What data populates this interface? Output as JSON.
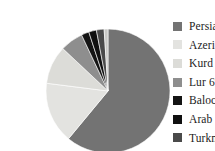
{
  "chart_data": {
    "type": "pie",
    "title": "",
    "subtitle": "",
    "xlabel": "",
    "ylabel": "",
    "grid": false,
    "legend_position": "right",
    "start_angle_deg": -90,
    "direction": "clockwise",
    "categories": [
      "Persian",
      "Azeri",
      "Kurd",
      "Lur",
      "Baloch",
      "Arab",
      "Turkmen",
      "Other"
    ],
    "values": [
      61,
      16,
      10,
      6,
      2,
      2,
      2,
      1
    ],
    "labels": [
      "Persian 6%",
      "Azeri 16%",
      "Kurd 10%",
      "Lur 6%",
      "Baloch 2%",
      "Arab 2%",
      "Turkmen 2%",
      "Other 1%"
    ],
    "colors": [
      "#737373",
      "#e3e3e0",
      "#dcdcd8",
      "#8e8e8e",
      "#141414",
      "#101010",
      "#4a4a4a",
      "#c9c9c6"
    ],
    "slices": [
      {
        "name": "Persian",
        "label": "Persian 6%",
        "value": 61,
        "percent": 61,
        "color": "#737373"
      },
      {
        "name": "Azeri",
        "label": "Azeri 16%",
        "value": 16,
        "percent": 16,
        "color": "#e3e3e0"
      },
      {
        "name": "Kurd",
        "label": "Kurd 10%",
        "value": 10,
        "percent": 10,
        "color": "#dcdcd8"
      },
      {
        "name": "Lur",
        "label": "Lur 6%",
        "value": 6,
        "percent": 6,
        "color": "#8e8e8e"
      },
      {
        "name": "Baloch",
        "label": "Baloch 2%",
        "value": 2,
        "percent": 2,
        "color": "#141414"
      },
      {
        "name": "Arab",
        "label": "Arab 2%",
        "value": 2,
        "percent": 2,
        "color": "#101010"
      },
      {
        "name": "Turkmen",
        "label": "Turkmen 2%",
        "value": 2,
        "percent": 2,
        "color": "#4a4a4a"
      },
      {
        "name": "Other",
        "label": "Other 1%",
        "value": 1,
        "percent": 1,
        "color": "#c9c9c6"
      }
    ]
  },
  "legend": {
    "items": [
      {
        "label": "Persian 6%",
        "color": "#737373",
        "name": "persian"
      },
      {
        "label": "Azeri 16%",
        "color": "#e3e3e0",
        "name": "azeri"
      },
      {
        "label": "Kurd 10%",
        "color": "#dcdcd8",
        "name": "kurd"
      },
      {
        "label": "Lur 6%",
        "color": "#8e8e8e",
        "name": "lur"
      },
      {
        "label": "Baloch 2%",
        "color": "#141414",
        "name": "baloch"
      },
      {
        "label": "Arab 2%",
        "color": "#101010",
        "name": "arab"
      },
      {
        "label": "Turkmen 2%",
        "color": "#4a4a4a",
        "name": "turkmen"
      },
      {
        "label": "Other 1%",
        "color": "#c9c9c6",
        "name": "other"
      }
    ]
  },
  "pie": {
    "center_x": 68,
    "center_y": 75,
    "radius": 62
  }
}
